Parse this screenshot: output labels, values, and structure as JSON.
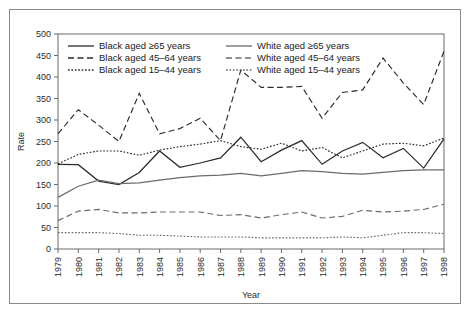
{
  "chart_data": {
    "type": "line",
    "title": "",
    "xlabel": "Year",
    "ylabel": "Rate",
    "xlim": [
      1979,
      1998
    ],
    "ylim": [
      0,
      500
    ],
    "ytick_step": 50,
    "grid": false,
    "legend_position": "top-left-inside",
    "yticks": [
      "0",
      "50",
      "100",
      "150",
      "200",
      "250",
      "300",
      "350",
      "400",
      "450",
      "500"
    ],
    "categories": [
      "1979",
      "1980",
      "1981",
      "1982",
      "1983",
      "1984",
      "1985",
      "1986",
      "1987",
      "1988",
      "1989",
      "1990",
      "1991",
      "1992",
      "1993",
      "1994",
      "1995",
      "1996",
      "1997",
      "1998"
    ],
    "series": [
      {
        "name": "Black aged ≥65 years",
        "style": "solid",
        "color": "#2b2b2b",
        "values": [
          197,
          196,
          158,
          150,
          178,
          228,
          190,
          200,
          212,
          260,
          203,
          230,
          252,
          197,
          228,
          248,
          212,
          234,
          188,
          256
        ]
      },
      {
        "name": "Black aged 45–64 years",
        "style": "dashed",
        "color": "#2b2b2b",
        "values": [
          268,
          324,
          288,
          250,
          362,
          268,
          280,
          304,
          252,
          416,
          376,
          376,
          378,
          304,
          364,
          370,
          444,
          386,
          336,
          460
        ]
      },
      {
        "name": "Black aged 15–44 years",
        "style": "dotted",
        "color": "#2b2b2b",
        "values": [
          198,
          220,
          228,
          228,
          218,
          230,
          238,
          244,
          252,
          238,
          232,
          246,
          228,
          236,
          212,
          228,
          244,
          246,
          240,
          258
        ]
      },
      {
        "name": "White aged ≥65 years",
        "style": "solid",
        "color": "#6b6b6b",
        "values": [
          120,
          146,
          160,
          152,
          154,
          160,
          166,
          170,
          172,
          176,
          170,
          176,
          182,
          180,
          176,
          174,
          178,
          182,
          184,
          184
        ]
      },
      {
        "name": "White aged 45–64 years",
        "style": "dashed",
        "color": "#6b6b6b",
        "values": [
          66,
          88,
          92,
          84,
          84,
          86,
          86,
          86,
          78,
          80,
          72,
          80,
          86,
          72,
          76,
          90,
          86,
          88,
          92,
          104
        ]
      },
      {
        "name": "White aged 15–44 years",
        "style": "dotted",
        "color": "#6b6b6b",
        "values": [
          38,
          38,
          38,
          36,
          32,
          32,
          30,
          28,
          28,
          28,
          26,
          26,
          26,
          26,
          28,
          26,
          32,
          38,
          38,
          36
        ]
      }
    ],
    "legend": [
      {
        "label": "Black aged ≥65 years",
        "style": "solid",
        "color": "#2b2b2b"
      },
      {
        "label": "White aged ≥65 years",
        "style": "solid",
        "color": "#6b6b6b"
      },
      {
        "label": "Black aged 45–64 years",
        "style": "dashed",
        "color": "#2b2b2b"
      },
      {
        "label": "White aged 45–64 years",
        "style": "dashed",
        "color": "#6b6b6b"
      },
      {
        "label": "Black aged 15–44 years",
        "style": "dotted",
        "color": "#2b2b2b"
      },
      {
        "label": "White aged 15–44 years",
        "style": "dotted",
        "color": "#6b6b6b"
      }
    ]
  }
}
